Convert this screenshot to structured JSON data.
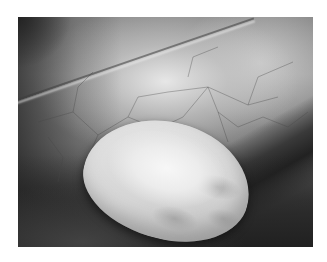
{
  "image": {
    "description": "Grayscale laparoscopic photograph showing a smooth, pale, ovoid cystic mass resting against vascularized membrane tissue",
    "colors": {
      "background": "#ffffff",
      "mass": "#e8e8e8",
      "tissue_dark": "#3a3a3a",
      "membrane": "#a0a0a0"
    }
  }
}
